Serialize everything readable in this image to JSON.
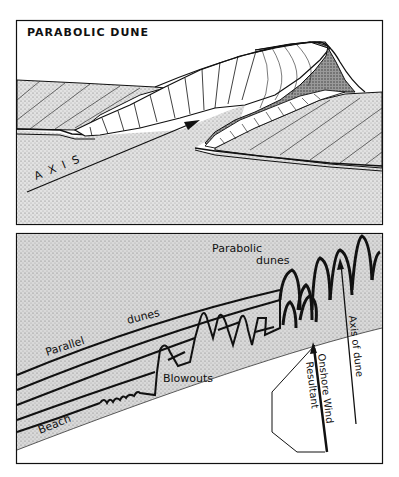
{
  "top_panel": {
    "title": "PARABOLIC  DUNE",
    "axis_label": "A X I S"
  },
  "bottom_panel": {
    "labels": {
      "parabolic_dunes_line1": "Parabolic",
      "parabolic_dunes_line2": "dunes",
      "parallel": "Parallel",
      "dunes": "dunes",
      "blowouts": "Blowouts",
      "beach": "Beach",
      "axis_of_dune": "Axis  of  dune",
      "onshore_wind": "Onshore  Wind",
      "resultant": "Resultant"
    }
  },
  "colors": {
    "ink": "#111111",
    "stipple_bg": "#d6d6d6",
    "paper": "#ffffff"
  }
}
